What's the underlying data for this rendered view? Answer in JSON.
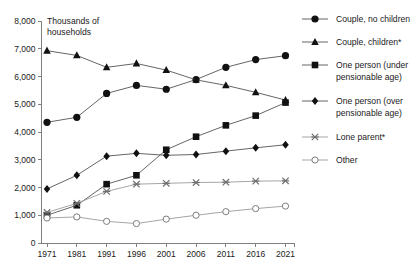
{
  "chart_data": {
    "type": "line",
    "title": "",
    "ylabel": "Thousands of households",
    "xlabel": "",
    "ylim": [
      0,
      8000
    ],
    "ytick_labels": [
      "0",
      "1,000",
      "2,000",
      "3,000",
      "4,000",
      "5,000",
      "6,000",
      "7,000",
      "8,000"
    ],
    "ytick_values": [
      0,
      1000,
      2000,
      3000,
      4000,
      5000,
      6000,
      7000,
      8000
    ],
    "grid": false,
    "legend_position": "right",
    "categories": [
      "1971",
      "1981",
      "1991",
      "1996",
      "2001",
      "2006",
      "2011",
      "2016",
      "2021"
    ],
    "x": [
      1971,
      1981,
      1991,
      1996,
      2001,
      2006,
      2011,
      2016,
      2021
    ],
    "series": [
      {
        "name": "Couple, no children",
        "marker": "filled-circle",
        "values": [
          4350,
          4530,
          5390,
          5680,
          5540,
          5890,
          6330,
          6610,
          6750
        ]
      },
      {
        "name": "Couple, children*",
        "marker": "filled-triangle",
        "values": [
          6930,
          6760,
          6330,
          6470,
          6230,
          5880,
          5680,
          5430,
          5150
        ]
      },
      {
        "name": "One person (under pensionable age)",
        "marker": "filled-square",
        "values": [
          1000,
          1360,
          2120,
          2440,
          3360,
          3830,
          4240,
          4590,
          5060
        ]
      },
      {
        "name": "One person (over pensionable age)",
        "marker": "filled-diamond",
        "values": [
          1950,
          2440,
          3130,
          3230,
          3160,
          3190,
          3310,
          3430,
          3540
        ]
      },
      {
        "name": "Lone parent*",
        "marker": "cross",
        "values": [
          1100,
          1430,
          1860,
          2120,
          2150,
          2180,
          2190,
          2230,
          2240
        ]
      },
      {
        "name": "Other",
        "marker": "open-circle",
        "values": [
          900,
          940,
          780,
          700,
          860,
          1000,
          1130,
          1240,
          1330
        ]
      }
    ],
    "footnotes": "* asterisk denotes dependent children"
  },
  "legend": {
    "entries": [
      {
        "label": "Couple, no children"
      },
      {
        "label": "Couple, children*"
      },
      {
        "label_line1": "One person (under",
        "label_line2": "pensionable age)"
      },
      {
        "label_line1": "One person (over",
        "label_line2": "pensionable age)"
      },
      {
        "label": "Lone parent*"
      },
      {
        "label": "Other"
      }
    ]
  },
  "colors": {
    "marker_dark": "#111111",
    "line_dark": "#545454",
    "line_light": "#9b9b9b",
    "axis": "#808080",
    "text": "#1a1a1a",
    "background": "#ffffff"
  },
  "axis_title": {
    "line1": "Thousands of",
    "line2": "households"
  }
}
